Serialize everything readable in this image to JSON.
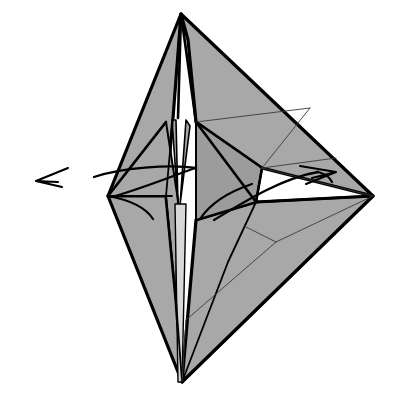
{
  "figure": {
    "title": "Origami folding step diagram",
    "kind": "line-drawing",
    "caption": "",
    "background_color": "#ffffff",
    "palette": {
      "paper_front": "#a8a8a8",
      "paper_shadow": "#9c9c9c",
      "paper_highlight": "#b2b2b2",
      "paper_white": "#d8d8d8",
      "ink": "#000000",
      "ink_thin": "#3a3a3a"
    },
    "canvas": {
      "width": 396,
      "height": 402
    },
    "key_points": {
      "apex_top": [
        181,
        14
      ],
      "bottom_tip": [
        182,
        382
      ],
      "left_vertex": [
        108,
        196
      ],
      "right_vertex": [
        373,
        196
      ],
      "center_node": [
        256,
        202
      ],
      "lower_y_node": [
        276,
        242
      ],
      "upper_fan_node": [
        262,
        168
      ]
    },
    "shapes": [
      {
        "name": "left-upper-panel",
        "fill": "#a8a8a8",
        "stroke_width": 3.2,
        "points": "181,14 173,118 166,196 108,196"
      },
      {
        "name": "left-lower-panel",
        "fill": "#a8a8a8",
        "stroke_width": 3.2,
        "points": "108,196 166,196 176,300 182,382"
      },
      {
        "name": "left-inner-flap",
        "fill": "#a8a8a8",
        "stroke_width": 2.0,
        "points": "166,122 178,200 176,300 166,196 108,196"
      },
      {
        "name": "right-upper-panel",
        "fill": "#a8a8a8",
        "stroke_width": 3.2,
        "points": "181,14 373,196 262,168 196,122 188,40"
      },
      {
        "name": "right-lower-panel",
        "fill": "#a8a8a8",
        "stroke_width": 3.2,
        "points": "182,382 373,196 256,202 196,220"
      },
      {
        "name": "right-mid-wedge",
        "fill": "#9c9c9c",
        "stroke_width": 2.0,
        "points": "196,122 262,168 256,202 196,220"
      },
      {
        "name": "center-spike-left",
        "fill": "#a8a8a8",
        "stroke_width": 1.6,
        "points": "172,120 178,205 176,120"
      },
      {
        "name": "center-spike-right",
        "fill": "#a8a8a8",
        "stroke_width": 1.6,
        "points": "186,120 180,205 190,126"
      },
      {
        "name": "center-strip",
        "fill": "#d8d8d8",
        "stroke_width": 1.4,
        "points": "175,204 186,204 182,382 178,382"
      }
    ],
    "fold_lines": [
      {
        "name": "apex-to-center-ridge",
        "d": "M 181 14 L 178 118",
        "weight": "fold-bold"
      },
      {
        "name": "apex-left-ridge",
        "d": "M 181 14 L 173 118 L 166 196",
        "weight": "fold-mid"
      },
      {
        "name": "apex-right-ridge",
        "d": "M 181 14 L 196 122 L 256 202",
        "weight": "fold-bold"
      },
      {
        "name": "left-wing-ridge",
        "d": "M 108 196 L 166 122",
        "weight": "fold-bold"
      },
      {
        "name": "left-wing-inner",
        "d": "M 108 196 L 172 196",
        "weight": "fold-mid"
      },
      {
        "name": "right-wing-ridge",
        "d": "M 196 122 L 262 168",
        "weight": "fold-mid"
      },
      {
        "name": "center-node-spoke-up",
        "d": "M 256 202 L 262 168",
        "weight": "fold-bold"
      },
      {
        "name": "center-node-spoke-right",
        "d": "M 256 202 L 373 196",
        "weight": "fold-bold"
      },
      {
        "name": "center-node-spoke-down",
        "d": "M 256 202 L 228 262 L 182 382",
        "weight": "fold-mid"
      },
      {
        "name": "right-lower-crease",
        "d": "M 182 382 L 373 196",
        "weight": "fold-bold"
      },
      {
        "name": "bottom-left-crease",
        "d": "M 182 382 L 176 300 L 166 196",
        "weight": "fold-mid"
      },
      {
        "name": "upper-thin-fan-a",
        "d": "M 262 168 L 310 108",
        "weight": "fold-thin"
      },
      {
        "name": "upper-thin-fan-b",
        "d": "M 262 168 L 336 158",
        "weight": "fold-thin"
      },
      {
        "name": "upper-thin-fan-c",
        "d": "M 262 168 L 373 196",
        "weight": "fold-thin"
      },
      {
        "name": "upper-thin-edge",
        "d": "M 196 122 L 310 108",
        "weight": "fold-thin"
      },
      {
        "name": "lower-y-stem",
        "d": "M 276 242 L 186 320",
        "weight": "fold-thin"
      },
      {
        "name": "lower-y-branch-up",
        "d": "M 276 242 L 244 226",
        "weight": "fold-thin"
      },
      {
        "name": "lower-y-branch-right",
        "d": "M 276 242 L 373 196",
        "weight": "fold-thin"
      },
      {
        "name": "lower-thin-to-tip",
        "d": "M 186 320 L 182 382",
        "weight": "fold-thin"
      }
    ],
    "crease_curves": [
      {
        "name": "left-curved-crease",
        "d": "M 108 196 C 130 200 146 208 153 219"
      },
      {
        "name": "center-curved-crease",
        "d": "M 252 184 C 228 192 210 204 200 219"
      }
    ],
    "arrows": [
      {
        "name": "left-fold-arrow",
        "direction": "left",
        "shaft": "M 112 197 C 150 186 182 172 196 168",
        "shaft_extra": "M 196 168 C 170 164 120 168 94 177",
        "head": "M 36 181 L 68 168 M 36 181 L 62 187 M 36 181 L 58 182",
        "tip": [
          36,
          181
        ],
        "tail": [
          112,
          197
        ]
      },
      {
        "name": "right-fold-arrow",
        "direction": "right",
        "shaft": "M 214 220 C 244 202 282 178 318 172",
        "shaft_extra": "M 318 172 C 326 174 330 178 332 182",
        "head": "M 336 172 L 300 166 M 336 172 L 306 184 M 336 172 L 312 178",
        "tip": [
          336,
          172
        ],
        "tail": [
          214,
          220
        ]
      }
    ]
  }
}
